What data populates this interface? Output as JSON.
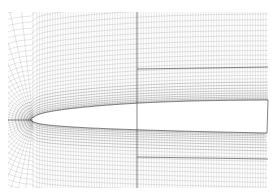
{
  "figure": {
    "title": "",
    "colors": {
      "background": "#ffffff",
      "grid_line": "#555555",
      "block_boundary": "#222222",
      "airfoil_fill": "#ffffff"
    },
    "extent": {
      "x0": 8,
      "y0": 12,
      "x1": 268,
      "y1": 188
    },
    "airfoil": {
      "leading_edge": [
        33,
        120
      ],
      "upper_te": [
        268,
        100
      ],
      "lower_te": [
        268,
        133
      ]
    },
    "block_boundaries": {
      "vertical_x": 137,
      "upper_horizontal_y": 69,
      "lower_horizontal_y": 157,
      "wake_line_y": 120
    }
  }
}
